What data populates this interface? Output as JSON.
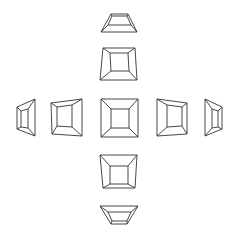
{
  "diagram": {
    "background": "#ffffff",
    "stroke_color": "#333333",
    "shapes": [
      {
        "id": "top-far",
        "label": "tilted top (far)",
        "outer": [
          [
            111,
            14
          ],
          [
            128,
            14
          ],
          [
            137,
            32
          ],
          [
            101,
            32
          ]
        ],
        "inner": [
          [
            112,
            16
          ],
          [
            127,
            16
          ],
          [
            131,
            25
          ],
          [
            108,
            25
          ]
        ]
      },
      {
        "id": "top-near",
        "label": "tilted top (near)",
        "outer": [
          [
            103,
            48
          ],
          [
            135,
            48
          ],
          [
            137,
            80
          ],
          [
            100,
            80
          ]
        ],
        "inner": [
          [
            110,
            53
          ],
          [
            128,
            53
          ],
          [
            129,
            71
          ],
          [
            111,
            71
          ]
        ]
      },
      {
        "id": "left-far",
        "label": "tilted left (far)",
        "outer": [
          [
            17,
            107
          ],
          [
            35,
            99
          ],
          [
            35,
            136
          ],
          [
            17,
            129
          ]
        ],
        "inner": [
          [
            21,
            111
          ],
          [
            28,
            109
          ],
          [
            28,
            128
          ],
          [
            21,
            127
          ]
        ]
      },
      {
        "id": "left-near",
        "label": "tilted left (near)",
        "outer": [
          [
            51,
            103
          ],
          [
            82,
            99
          ],
          [
            82,
            136
          ],
          [
            52,
            134
          ]
        ],
        "inner": [
          [
            57,
            107
          ],
          [
            72,
            105
          ],
          [
            72,
            127
          ],
          [
            57,
            126
          ]
        ]
      },
      {
        "id": "center",
        "label": "frontal view",
        "outer": [
          [
            101,
            99
          ],
          [
            138,
            99
          ],
          [
            138,
            137
          ],
          [
            101,
            137
          ]
        ],
        "inner": [
          [
            111,
            109
          ],
          [
            129,
            109
          ],
          [
            129,
            128
          ],
          [
            111,
            128
          ]
        ]
      },
      {
        "id": "right-near",
        "label": "tilted right (near)",
        "outer": [
          [
            157,
            99
          ],
          [
            187,
            103
          ],
          [
            187,
            134
          ],
          [
            157,
            136
          ]
        ],
        "inner": [
          [
            167,
            105
          ],
          [
            182,
            107
          ],
          [
            182,
            126
          ],
          [
            167,
            127
          ]
        ]
      },
      {
        "id": "right-far",
        "label": "tilted right (far)",
        "outer": [
          [
            205,
            99
          ],
          [
            222,
            107
          ],
          [
            222,
            129
          ],
          [
            205,
            136
          ]
        ],
        "inner": [
          [
            212,
            109
          ],
          [
            218,
            111
          ],
          [
            218,
            127
          ],
          [
            212,
            128
          ]
        ]
      },
      {
        "id": "bottom-near",
        "label": "tilted bottom (near)",
        "outer": [
          [
            100,
            155
          ],
          [
            137,
            155
          ],
          [
            135,
            188
          ],
          [
            103,
            188
          ]
        ],
        "inner": [
          [
            110,
            166
          ],
          [
            128,
            166
          ],
          [
            128,
            184
          ],
          [
            110,
            184
          ]
        ]
      },
      {
        "id": "bottom-far",
        "label": "tilted bottom (far)",
        "outer": [
          [
            100,
            206
          ],
          [
            138,
            206
          ],
          [
            127,
            224
          ],
          [
            111,
            224
          ]
        ],
        "inner": [
          [
            108,
            212
          ],
          [
            131,
            212
          ],
          [
            127,
            221
          ],
          [
            112,
            221
          ]
        ]
      }
    ]
  }
}
